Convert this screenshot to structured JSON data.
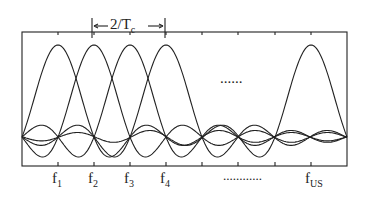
{
  "diagram": {
    "title_annotation": "2/Tc",
    "spacing_label": "2/T",
    "spacing_sub": "c",
    "subcarriers": [
      {
        "label": "f",
        "sub": "1",
        "x": 58
      },
      {
        "label": "f",
        "sub": "2",
        "x": 94
      },
      {
        "label": "f",
        "sub": "3",
        "x": 130
      },
      {
        "label": "f",
        "sub": "4",
        "x": 166
      },
      {
        "label": "f",
        "sub": "US",
        "x": 311
      }
    ],
    "ellipsis_mid": "......",
    "ellipsis_axis": "............",
    "colors": {
      "line": "#222222",
      "background": "#ffffff"
    }
  }
}
